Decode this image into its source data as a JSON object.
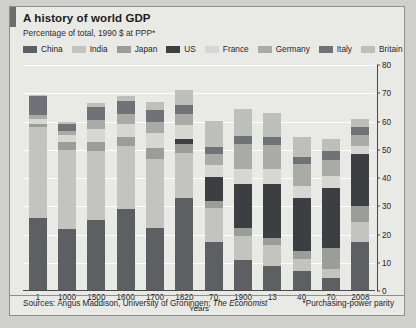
{
  "header": {
    "title": "A history of world GDP",
    "subtitle": "Percentage of total, 1990 $ at PPP*"
  },
  "footer": {
    "sources_prefix": "Sources: Angus Maddison, University of Groningen; ",
    "sources_italic": "The Economist",
    "note": "*Purchasing-power parity"
  },
  "colors": {
    "china": "#5d6063",
    "india": "#c3c4bf",
    "japan": "#9b9d99",
    "us": "#3c3f42",
    "france": "#d6d7d2",
    "germany": "#a9aba6",
    "italy": "#6f7276",
    "britain": "#bdbfba",
    "panel": "#e9e9e5",
    "gridline": "#ffffff",
    "axis": "#4a4a4a"
  },
  "chart_data": {
    "type": "bar",
    "subtype": "stacked",
    "title": "A history of world GDP",
    "subtitle": "Percentage of total, 1990 $ at PPP*",
    "xlabel": "Years",
    "ylabel": "",
    "ylim": [
      0,
      80
    ],
    "yticks": [
      0,
      10,
      20,
      30,
      40,
      50,
      60,
      70,
      80
    ],
    "grid": true,
    "legend_position": "top",
    "categories": [
      "1",
      "1000",
      "1500",
      "1600",
      "1700",
      "1820",
      "70",
      "1900",
      "13",
      "40",
      "70",
      "2008"
    ],
    "series": [
      {
        "name": "China",
        "color": "#5d6063",
        "values": [
          26.0,
          22.0,
          25.0,
          29.0,
          22.2,
          32.9,
          17.2,
          11.0,
          8.8,
          7.0,
          4.6,
          17.5
        ]
      },
      {
        "name": "India",
        "color": "#c3c4bf",
        "values": [
          32.0,
          28.0,
          24.5,
          22.5,
          24.4,
          16.0,
          12.2,
          8.6,
          7.5,
          4.2,
          3.1,
          6.8
        ]
      },
      {
        "name": "Japan",
        "color": "#9b9d99",
        "values": [
          1.2,
          2.7,
          3.1,
          2.9,
          4.1,
          3.0,
          2.3,
          2.6,
          2.6,
          3.0,
          7.7,
          5.7
        ]
      },
      {
        "name": "US",
        "color": "#3c3f42",
        "values": [
          0.0,
          0.0,
          0.3,
          0.2,
          0.1,
          1.8,
          8.8,
          15.8,
          18.9,
          18.6,
          21.1,
          18.6
        ]
      },
      {
        "name": "France",
        "color": "#d6d7d2",
        "values": [
          1.6,
          2.4,
          4.4,
          4.7,
          5.3,
          5.1,
          4.2,
          5.3,
          5.3,
          4.4,
          4.1,
          2.9
        ]
      },
      {
        "name": "Germany",
        "color": "#a9aba6",
        "values": [
          1.4,
          1.6,
          3.3,
          3.5,
          3.6,
          3.8,
          3.9,
          8.7,
          8.7,
          7.8,
          5.9,
          3.9
        ]
      },
      {
        "name": "Italy",
        "color": "#6f7276",
        "values": [
          7.0,
          2.3,
          4.7,
          4.4,
          4.4,
          3.2,
          2.5,
          2.9,
          2.9,
          2.5,
          3.2,
          2.5
        ]
      },
      {
        "name": "Britain",
        "color": "#bdbfba",
        "values": [
          0.3,
          0.7,
          1.1,
          1.8,
          2.9,
          5.2,
          9.1,
          9.4,
          8.3,
          6.9,
          4.2,
          2.9
        ]
      }
    ],
    "totals": [
      69.5,
      59.7,
      66.4,
      70.0,
      67.0,
      71.0,
      60.2,
      64.3,
      63.0,
      54.4,
      53.9,
      60.8
    ]
  },
  "legend": [
    {
      "label": "China",
      "swatch": "#5d6063"
    },
    {
      "label": "India",
      "swatch": "#c3c4bf"
    },
    {
      "label": "Japan",
      "swatch": "#9b9d99"
    },
    {
      "label": "US",
      "swatch": "#3c3f42"
    },
    {
      "label": "France",
      "swatch": "#d6d7d2"
    },
    {
      "label": "Germany",
      "swatch": "#a9aba6"
    },
    {
      "label": "Italy",
      "swatch": "#6f7276"
    },
    {
      "label": "Britain",
      "swatch": "#bdbfba"
    }
  ]
}
